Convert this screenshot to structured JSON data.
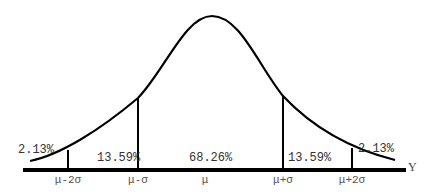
{
  "diagram": {
    "type": "normal-distribution",
    "axis_label": "Y",
    "ticks": [
      "μ-2σ",
      "μ-σ",
      "μ",
      "μ+σ",
      "μ+2σ"
    ],
    "regions": [
      {
        "label": "2.13%",
        "position": "left-tail"
      },
      {
        "label": "13.59%",
        "position": "mu-minus-sigma-to-mu-minus-2sigma"
      },
      {
        "label": "68.26%",
        "position": "center"
      },
      {
        "label": "13.59%",
        "position": "mu-plus-sigma-to-mu-plus-2sigma"
      },
      {
        "label": "2.13%",
        "position": "right-tail"
      }
    ],
    "colors": {
      "line": "#000000",
      "text": "#333333",
      "background": "#ffffff"
    }
  }
}
